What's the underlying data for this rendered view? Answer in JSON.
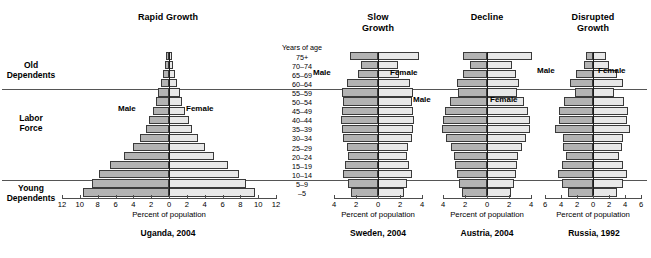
{
  "figure": {
    "axis_title": "Percent of population",
    "age_axis_header": "Years of age",
    "male_label": "Male",
    "female_label": "Female",
    "age_groups": [
      "75+",
      "70–74",
      "65–69",
      "60–64",
      "55–59",
      "50–54",
      "45–49",
      "40–44",
      "35–39",
      "30–34",
      "25–29",
      "20–24",
      "15–19",
      "10–14",
      "5–9",
      "–5"
    ],
    "side_labels": [
      {
        "name": "old-dependents",
        "text": "Old\nDependents"
      },
      {
        "name": "labor-force",
        "text": "Labor\nForce"
      },
      {
        "name": "young-dependents",
        "text": "Young\nDependents"
      }
    ],
    "colors": {
      "male_fill": "#b3b3b3",
      "female_fill": "#e8e8e8",
      "bar_stroke": "#3a3a3a",
      "axis": "#4d4d4d",
      "divider": "#555555",
      "text": "#000000"
    }
  },
  "chart_data": [
    {
      "type": "bar",
      "name": "uganda",
      "title": "Rapid Growth",
      "caption": "Uganda, 2004",
      "xlabel": "Percent of population",
      "ylabel": "Years of age",
      "grid": false,
      "legend": [
        "Male",
        "Female"
      ],
      "categories": [
        "75+",
        "70–74",
        "65–69",
        "60–64",
        "55–59",
        "50–54",
        "45–49",
        "40–44",
        "35–39",
        "30–34",
        "25–29",
        "20–24",
        "15–19",
        "10–14",
        "5–9",
        "–5"
      ],
      "xlim": [
        -12,
        12
      ],
      "xticks": [
        12,
        10,
        8,
        6,
        4,
        2,
        0,
        2,
        4,
        6,
        8,
        10,
        12
      ],
      "series": [
        {
          "name": "Male",
          "values": [
            0.35,
            0.5,
            0.7,
            0.95,
            1.2,
            1.5,
            1.85,
            2.2,
            2.6,
            3.2,
            4.0,
            5.0,
            6.6,
            7.9,
            8.6,
            9.6
          ]
        },
        {
          "name": "Female",
          "values": [
            0.35,
            0.5,
            0.7,
            0.95,
            1.2,
            1.5,
            1.85,
            2.2,
            2.6,
            3.2,
            4.0,
            5.0,
            6.6,
            7.9,
            8.6,
            9.6
          ]
        }
      ]
    },
    {
      "type": "bar",
      "name": "sweden",
      "title": "Slow\nGrowth",
      "caption": "Sweden, 2004",
      "xlabel": "Percent of population",
      "ylabel": "Years of age",
      "grid": false,
      "legend": [
        "Male",
        "Female"
      ],
      "categories": [
        "75+",
        "70–74",
        "65–69",
        "60–64",
        "55–59",
        "50–54",
        "45–49",
        "40–44",
        "35–39",
        "30–34",
        "25–29",
        "20–24",
        "15–19",
        "10–14",
        "5–9",
        "–5"
      ],
      "xlim": [
        -4,
        4
      ],
      "xticks": [
        4,
        2,
        0,
        2,
        4
      ],
      "series": [
        {
          "name": "Male",
          "values": [
            2.55,
            1.55,
            1.8,
            2.85,
            3.25,
            3.15,
            3.25,
            3.4,
            3.3,
            3.2,
            2.85,
            2.75,
            3.0,
            3.2,
            2.7,
            2.5
          ]
        },
        {
          "name": "Female",
          "values": [
            3.75,
            1.85,
            1.9,
            2.9,
            3.2,
            3.05,
            3.15,
            3.25,
            3.2,
            3.1,
            2.75,
            2.65,
            2.85,
            3.05,
            2.6,
            2.4
          ]
        }
      ]
    },
    {
      "type": "bar",
      "name": "austria",
      "title": "Decline",
      "caption": "Austria, 2004",
      "xlabel": "Percent of population",
      "ylabel": "Years of age",
      "grid": false,
      "legend": [
        "Male",
        "Female"
      ],
      "categories": [
        "75+",
        "70–74",
        "65–69",
        "60–64",
        "55–59",
        "50–54",
        "45–49",
        "40–44",
        "35–39",
        "30–34",
        "25–29",
        "20–24",
        "15–19",
        "10–14",
        "5–9",
        "–5"
      ],
      "xlim": [
        -4,
        4
      ],
      "xticks": [
        4,
        2,
        0,
        2,
        4
      ],
      "series": [
        {
          "name": "Male",
          "values": [
            2.15,
            1.55,
            2.2,
            2.7,
            2.65,
            3.35,
            3.8,
            4.0,
            4.1,
            3.7,
            3.3,
            3.0,
            2.9,
            2.75,
            2.55,
            2.3
          ]
        },
        {
          "name": "Female",
          "values": [
            4.1,
            2.3,
            2.6,
            2.9,
            2.75,
            3.35,
            3.7,
            3.9,
            3.95,
            3.55,
            3.15,
            2.85,
            2.75,
            2.6,
            2.45,
            2.2
          ]
        }
      ]
    },
    {
      "type": "bar",
      "name": "russia",
      "title": "Disrupted\nGrowth",
      "caption": "Russia, 1992",
      "xlabel": "Percent of population",
      "ylabel": "Years of age",
      "grid": false,
      "legend": [
        "Male",
        "Female"
      ],
      "categories": [
        "75+",
        "70–74",
        "65–69",
        "60–64",
        "55–59",
        "50–54",
        "45–49",
        "40–44",
        "35–39",
        "30–34",
        "25–29",
        "20–24",
        "15–19",
        "10–14",
        "5–9",
        "–5"
      ],
      "xlim": [
        -6,
        6
      ],
      "xticks": [
        6,
        4,
        2,
        0,
        2,
        4,
        6
      ],
      "series": [
        {
          "name": "Male",
          "values": [
            0.85,
            1.1,
            2.1,
            2.9,
            2.3,
            3.6,
            4.3,
            4.3,
            4.7,
            3.8,
            3.7,
            3.4,
            3.9,
            4.4,
            3.9,
            3.1
          ]
        },
        {
          "name": "Female",
          "values": [
            1.6,
            2.0,
            3.0,
            3.7,
            2.6,
            3.9,
            4.4,
            4.3,
            4.6,
            3.7,
            3.6,
            3.3,
            3.8,
            4.3,
            3.75,
            3.0
          ]
        }
      ]
    }
  ],
  "layout": {
    "panels": [
      {
        "name": "uganda",
        "plot_left": 62,
        "plot_width": 214,
        "title_cx": 168,
        "caption_cx": 168
      },
      {
        "name": "sweden",
        "plot_left": 334,
        "plot_width": 88,
        "title_cx": 378,
        "caption_cx": 378
      },
      {
        "name": "austria",
        "plot_left": 443,
        "plot_width": 88,
        "title_cx": 487,
        "caption_cx": 487
      },
      {
        "name": "russia",
        "plot_left": 545,
        "plot_width": 96,
        "title_cx": 593,
        "caption_cx": 593
      }
    ],
    "plot_top": 52,
    "row_height": 9.1,
    "bar_height": 8.2,
    "title_top": 12,
    "axis_line_y": 198,
    "tick_label_y": 200,
    "axis_title_y": 210,
    "caption_y": 228,
    "age_col_left": 276,
    "age_col_width": 52,
    "age_header_y": 43,
    "dividers": [
      {
        "name": "divider-old-labor",
        "y": 89,
        "x": 2,
        "w": 645
      },
      {
        "name": "divider-labor-young",
        "y": 180,
        "x": 2,
        "w": 645
      }
    ],
    "side_label_positions": [
      {
        "y": 60,
        "x": 2,
        "w": 58
      },
      {
        "y": 113,
        "x": 2,
        "w": 58
      },
      {
        "y": 183,
        "x": 2,
        "w": 58
      }
    ],
    "mf_labels": [
      {
        "panel": "uganda",
        "which": "male",
        "x": 118,
        "y": 104
      },
      {
        "panel": "uganda",
        "which": "female",
        "x": 186,
        "y": 104
      },
      {
        "panel": "sweden",
        "which": "male",
        "x": 313,
        "y": 68
      },
      {
        "panel": "sweden",
        "which": "female",
        "x": 390,
        "y": 68
      },
      {
        "panel": "austria",
        "which": "male",
        "x": 413,
        "y": 95
      },
      {
        "panel": "austria",
        "which": "female",
        "x": 490,
        "y": 95
      },
      {
        "panel": "russia",
        "which": "male",
        "x": 537,
        "y": 66
      },
      {
        "panel": "russia",
        "which": "female",
        "x": 598,
        "y": 66
      }
    ]
  }
}
